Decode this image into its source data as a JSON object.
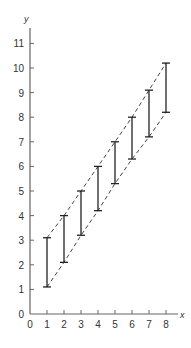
{
  "chart_data": {
    "type": "line",
    "title": "",
    "xlabel": "x",
    "ylabel": "y",
    "xlim": [
      0,
      8.5
    ],
    "ylim": [
      0,
      11.5
    ],
    "x_ticks": [
      0,
      1,
      2,
      3,
      4,
      5,
      6,
      7,
      8
    ],
    "y_ticks": [
      0,
      1,
      2,
      3,
      4,
      5,
      6,
      7,
      8,
      9,
      10,
      11
    ],
    "grid": false,
    "series": [
      {
        "name": "interval_lower",
        "x": [
          1,
          2,
          3,
          4,
          5,
          6,
          7,
          8
        ],
        "values": [
          1.1,
          2.1,
          3.2,
          4.2,
          5.3,
          6.3,
          7.2,
          8.2
        ]
      },
      {
        "name": "interval_upper",
        "x": [
          1,
          2,
          3,
          4,
          5,
          6,
          7,
          8
        ],
        "values": [
          3.1,
          4.0,
          5.0,
          6.0,
          7.0,
          8.0,
          9.1,
          10.2
        ]
      }
    ],
    "annotations": [
      "vertical error-bar intervals at x=1..8",
      "dashed lines connecting lower and upper bounds"
    ]
  }
}
